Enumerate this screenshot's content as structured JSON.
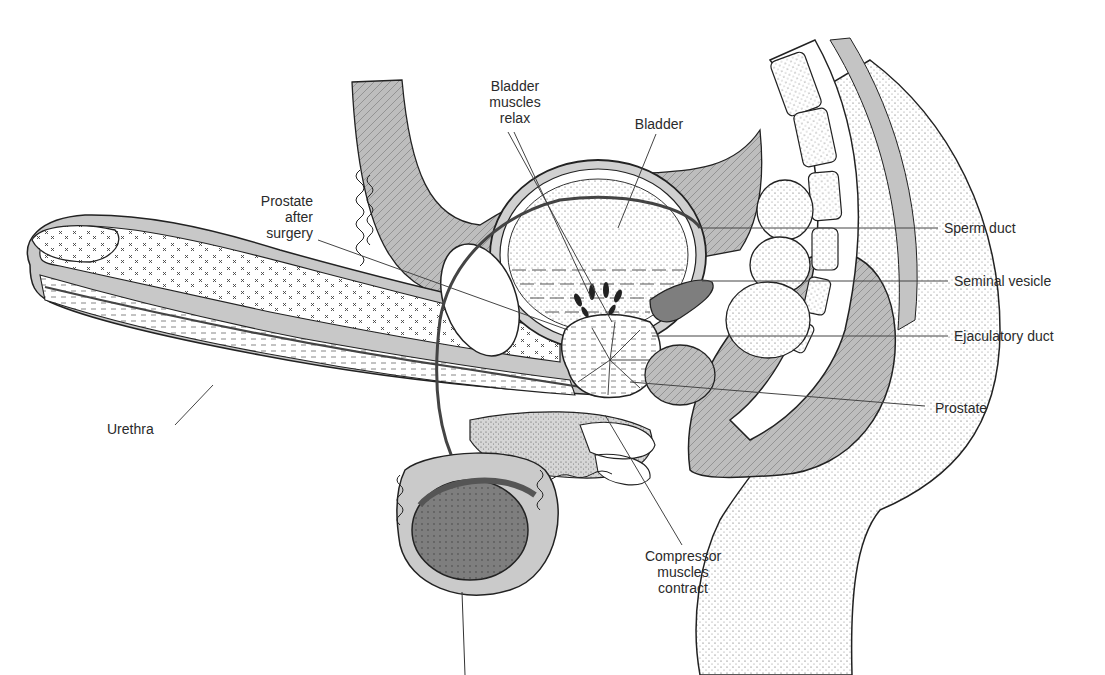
{
  "diagram": {
    "colors": {
      "background": "#ffffff",
      "tissue_gray": "#c8c8c8",
      "dark_gray": "#8a8a8a",
      "outline": "#1e1e1e",
      "label_text": "#2a2a2a",
      "leader_line": "#444444"
    },
    "labels": [
      {
        "id": "bladder-muscles-relax",
        "text": "Bladder\nmuscles\nrelax",
        "x": 470,
        "y": 78,
        "w": 90,
        "align": "center",
        "leaders": [
          [
            514,
            132,
            592,
            300
          ],
          [
            508,
            132,
            612,
            322
          ]
        ]
      },
      {
        "id": "bladder",
        "text": "Bladder",
        "x": 624,
        "y": 116,
        "w": 70,
        "align": "center",
        "leaders": [
          [
            656,
            134,
            618,
            228
          ]
        ]
      },
      {
        "id": "prostate-after-surgery",
        "text": "Prostate\nafter\nsurgery",
        "x": 218,
        "y": 193,
        "w": 95,
        "align": "right",
        "leaders": [
          [
            318,
            240,
            568,
            330
          ]
        ]
      },
      {
        "id": "sperm-duct",
        "text": "Sperm duct",
        "x": 944,
        "y": 220,
        "w": 120,
        "align": "left",
        "leaders": [
          [
            938,
            228,
            700,
            228
          ]
        ]
      },
      {
        "id": "seminal-vesicle",
        "text": "Seminal vesicle",
        "x": 954,
        "y": 273,
        "w": 150,
        "align": "left",
        "leaders": [
          [
            948,
            281,
            702,
            281
          ]
        ]
      },
      {
        "id": "ejaculatory-duct",
        "text": "Ejaculatory duct",
        "x": 954,
        "y": 328,
        "w": 150,
        "align": "left",
        "leaders": [
          [
            948,
            336,
            652,
            336
          ]
        ]
      },
      {
        "id": "prostate",
        "text": "Prostate",
        "x": 935,
        "y": 400,
        "w": 90,
        "align": "left",
        "leaders": [
          [
            925,
            406,
            630,
            382
          ]
        ]
      },
      {
        "id": "urethra",
        "text": "Urethra",
        "x": 107,
        "y": 421,
        "w": 70,
        "align": "left",
        "leaders": [
          [
            175,
            425,
            213,
            385
          ]
        ]
      },
      {
        "id": "compressor-muscles-contract",
        "text": "Compressor\nmuscles\ncontract",
        "x": 628,
        "y": 548,
        "w": 110,
        "align": "center",
        "leaders": [
          [
            682,
            545,
            605,
            415
          ]
        ]
      }
    ]
  }
}
